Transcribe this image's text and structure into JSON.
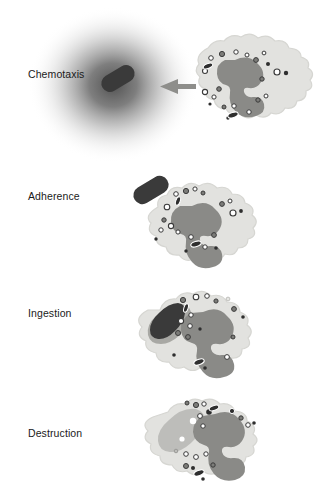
{
  "figure": {
    "background_color": "#ffffff"
  },
  "palette": {
    "cytoplasm": "#e2e2df",
    "cytoplasm_edge": "#d4d4d0",
    "nucleus": "#8a8a87",
    "bacterium": "#3a3a3a",
    "pseudopod": "#a8a8a4",
    "phagosome": "#bdbdba",
    "granule_open_fill": "#ffffff",
    "granule_open_stroke": "#3a3a3a",
    "granule_filled": "#2e2e2e",
    "granule_mid": "#7c7c79",
    "arrow": "#8e8e8b",
    "gradient_center": "#4a4a4a",
    "label_color": "#1a1a1a"
  },
  "stages": [
    {
      "id": "chemotaxis",
      "label": "Chemotaxis",
      "label_x": 28,
      "label_y": 68,
      "description": "Bacterium releases a chemoattractant gradient; phagocyte migrates toward it",
      "has_gradient_cloud": true,
      "has_arrow": true,
      "bacterium_state": "free-in-gradient",
      "bacterium_engulfed": false
    },
    {
      "id": "adherence",
      "label": "Adherence",
      "label_x": 28,
      "label_y": 190,
      "description": "Bacterium binds to the phagocyte surface membrane",
      "has_gradient_cloud": false,
      "has_arrow": false,
      "bacterium_state": "attached-to-membrane",
      "bacterium_engulfed": false
    },
    {
      "id": "ingestion",
      "label": "Ingestion",
      "label_x": 28,
      "label_y": 307,
      "description": "Pseudopods extend around the bacterium forming a phagosome",
      "has_gradient_cloud": false,
      "has_arrow": false,
      "bacterium_state": "wrapped-by-pseudopod",
      "bacterium_engulfed": false
    },
    {
      "id": "destruction",
      "label": "Destruction",
      "label_x": 28,
      "label_y": 427,
      "description": "Granules fuse with the phagosome and the bacterium is degraded",
      "has_gradient_cloud": false,
      "has_arrow": false,
      "bacterium_state": "degraded-in-phagolysosome",
      "bacterium_engulfed": true
    }
  ]
}
